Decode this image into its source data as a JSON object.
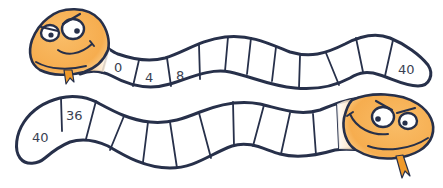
{
  "game": {
    "type": "number-track-snakes",
    "colors": {
      "outline": "#27304a",
      "head_fill": "#f7b35a",
      "head_highlight": "#fde3b5",
      "tongue": "#f09a2a",
      "cell_fill": "#ffffff"
    },
    "top_snake": {
      "cells": [
        "0",
        "4",
        "8",
        "",
        "",
        "",
        "",
        "",
        "",
        "",
        "40"
      ],
      "start_label": "0",
      "end_label": "40"
    },
    "bottom_snake": {
      "cells": [
        "40",
        "36",
        "",
        "",
        "",
        "",
        "",
        "",
        "",
        "",
        ""
      ],
      "start_label": "40",
      "second_label": "36"
    }
  }
}
